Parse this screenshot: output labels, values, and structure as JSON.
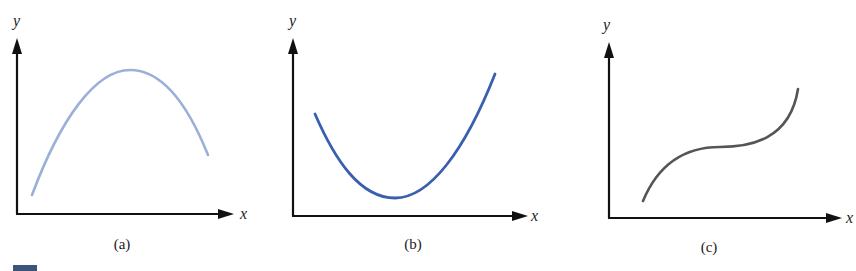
{
  "figure": {
    "panels": [
      {
        "id": "a",
        "caption": "(a)",
        "x_label": "x",
        "y_label": "y",
        "curve_shape": "concave-down parabola (maximum)",
        "curve_color": "#9ab0d8"
      },
      {
        "id": "b",
        "caption": "(b)",
        "x_label": "x",
        "y_label": "y",
        "curve_shape": "concave-up parabola (minimum)",
        "curve_color": "#3a5fae"
      },
      {
        "id": "c",
        "caption": "(c)",
        "x_label": "x",
        "y_label": "y",
        "curve_shape": "cubic with inflection point",
        "curve_color": "#555555"
      }
    ],
    "corner_mark_color": "#3a5578"
  }
}
